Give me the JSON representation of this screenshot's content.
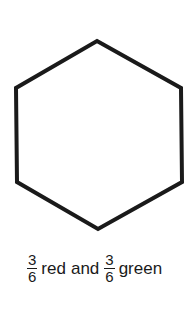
{
  "figure": {
    "shape": "hexagon",
    "stroke_color": "#1a1a1a",
    "fill_color": "#ffffff",
    "points": "97,41 181,88 182,182 98,229 17,182 16,88"
  },
  "caption": {
    "fraction1": {
      "numerator": "3",
      "denominator": "6"
    },
    "word1": "red",
    "connector": "and",
    "fraction2": {
      "numerator": "3",
      "denominator": "6"
    },
    "word2": "green"
  }
}
